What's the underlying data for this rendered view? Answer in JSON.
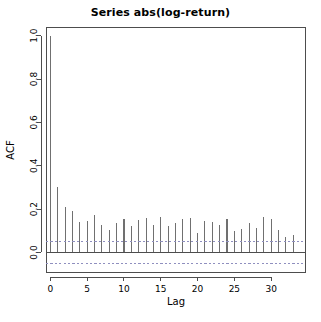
{
  "chart_data": {
    "type": "bar",
    "title": "Series  abs(log-return)",
    "xlabel": "Lag",
    "ylabel": "ACF",
    "xlim": [
      -0.6,
      34.6
    ],
    "ylim": [
      -0.09,
      1.04
    ],
    "grid": false,
    "legend": null,
    "x_ticks": [
      0,
      5,
      10,
      15,
      20,
      25,
      30
    ],
    "y_ticks": [
      0.0,
      0.2,
      0.4,
      0.6,
      0.8,
      1.0
    ],
    "x_tick_labels": [
      "0",
      "5",
      "10",
      "15",
      "20",
      "25",
      "30"
    ],
    "y_tick_labels": [
      "0.0",
      "0.2",
      "0.4",
      "0.6",
      "0.8",
      "1.0"
    ],
    "confidence_bands": [
      0.052,
      -0.052
    ],
    "confidence_band_style": "dashed",
    "confidence_band_color": "#8f8fbf",
    "bar_color": "#707070",
    "zero_line": 0.0,
    "x": [
      0,
      1,
      2,
      3,
      4,
      5,
      6,
      7,
      8,
      9,
      10,
      11,
      12,
      13,
      14,
      15,
      16,
      17,
      18,
      19,
      20,
      21,
      22,
      23,
      24,
      25,
      26,
      27,
      28,
      29,
      30,
      31,
      32,
      33
    ],
    "values": [
      1.0,
      0.3,
      0.21,
      0.19,
      0.14,
      0.145,
      0.175,
      0.125,
      0.105,
      0.135,
      0.155,
      0.12,
      0.15,
      0.16,
      0.125,
      0.165,
      0.12,
      0.135,
      0.155,
      0.16,
      0.09,
      0.145,
      0.14,
      0.125,
      0.155,
      0.1,
      0.11,
      0.135,
      0.115,
      0.165,
      0.155,
      0.105,
      0.07,
      0.08
    ],
    "categories": [
      "0",
      "1",
      "2",
      "3",
      "4",
      "5",
      "6",
      "7",
      "8",
      "9",
      "10",
      "11",
      "12",
      "13",
      "14",
      "15",
      "16",
      "17",
      "18",
      "19",
      "20",
      "21",
      "22",
      "23",
      "24",
      "25",
      "26",
      "27",
      "28",
      "29",
      "30",
      "31",
      "32",
      "33"
    ]
  }
}
